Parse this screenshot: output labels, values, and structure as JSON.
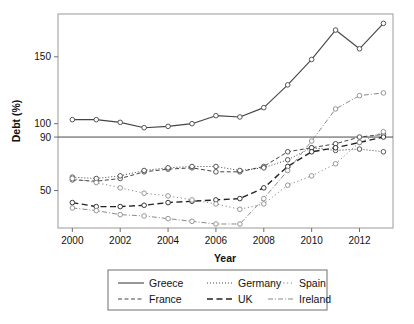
{
  "chart_data": {
    "type": "line",
    "title": "",
    "xlabel": "Year",
    "ylabel": "Debt (%)",
    "x": [
      2000,
      2001,
      2002,
      2003,
      2004,
      2005,
      2006,
      2007,
      2008,
      2009,
      2010,
      2011,
      2012,
      2013
    ],
    "xlim": [
      1999.4,
      2013.4
    ],
    "ylim": [
      22,
      182
    ],
    "xticks": [
      2000,
      2002,
      2004,
      2006,
      2008,
      2010,
      2012
    ],
    "xticklabels": [
      "2000",
      "2002",
      "2004",
      "2006",
      "2008",
      "2010",
      "2012"
    ],
    "yticks": [
      50,
      90,
      100,
      150
    ],
    "yticklabels": [
      "50",
      "90",
      "100",
      "150"
    ],
    "grid": false,
    "reference_line": {
      "value": 90,
      "orientation": "horizontal"
    },
    "legend_position": "bottom",
    "marker": "open-circle",
    "series": [
      {
        "name": "Greece",
        "dash": "none",
        "color": "#444444",
        "width": 1.1,
        "values": [
          103,
          103,
          101,
          97,
          98,
          100,
          106,
          105,
          112,
          129,
          148,
          170,
          156,
          175
        ]
      },
      {
        "name": "France",
        "dash": "dashed",
        "color": "#444444",
        "width": 1.0,
        "values": [
          58,
          57,
          59,
          64,
          66,
          67,
          64,
          64,
          68,
          79,
          82,
          85,
          90,
          92
        ]
      },
      {
        "name": "Germany",
        "dash": "dotted",
        "color": "#444444",
        "width": 1.0,
        "values": [
          60,
          59,
          61,
          65,
          67,
          68,
          68,
          65,
          67,
          73,
          82,
          80,
          81,
          79
        ]
      },
      {
        "name": "UK",
        "dash": "long-dash",
        "color": "#222222",
        "width": 1.4,
        "values": [
          41,
          38,
          38,
          39,
          41,
          42,
          43,
          44,
          52,
          68,
          79,
          82,
          86,
          90
        ]
      },
      {
        "name": "Spain",
        "dash": "fine-dotted",
        "color": "#8a8a8a",
        "width": 1.0,
        "values": [
          59,
          56,
          52,
          48,
          46,
          43,
          40,
          36,
          40,
          54,
          61,
          70,
          86,
          94
        ]
      },
      {
        "name": "Ireland",
        "dash": "dash-dot",
        "color": "#8a8a8a",
        "width": 1.0,
        "values": [
          37,
          35,
          32,
          31,
          29,
          27,
          25,
          25,
          44,
          65,
          87,
          111,
          121,
          123
        ]
      }
    ]
  },
  "legend": {
    "entries": [
      {
        "label": "Greece"
      },
      {
        "label": "Germany"
      },
      {
        "label": "Spain"
      },
      {
        "label": "France"
      },
      {
        "label": "UK"
      },
      {
        "label": "Ireland"
      }
    ]
  }
}
